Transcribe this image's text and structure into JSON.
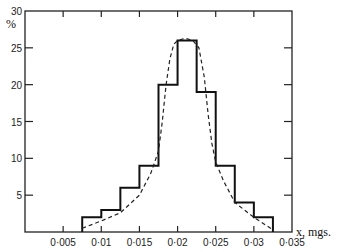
{
  "chart_data": {
    "type": "bar",
    "subtype": "histogram-with-fitted-curve",
    "title": "",
    "xlabel": "x, mgs.",
    "ylabel": "%",
    "xlim": [
      0,
      0.035
    ],
    "ylim": [
      0,
      30
    ],
    "grid": false,
    "legend": null,
    "x_ticks": [
      0.005,
      0.01,
      0.015,
      0.02,
      0.025,
      0.03,
      0.035
    ],
    "x_tick_labels": [
      "0·005",
      "0·01",
      "0·015",
      "0·02",
      "0·025",
      "0·03",
      "0·035"
    ],
    "y_ticks": [
      5,
      10,
      15,
      20,
      25,
      30
    ],
    "y_tick_labels": [
      "5",
      "10",
      "15",
      "20",
      "25",
      "30"
    ],
    "bin_edges": [
      0.0075,
      0.01,
      0.0125,
      0.015,
      0.0175,
      0.02,
      0.0225,
      0.025,
      0.0275,
      0.03,
      0.0325
    ],
    "series": [
      {
        "name": "Observed frequency (histogram)",
        "style": "solid-step",
        "values": [
          2,
          3,
          6,
          9,
          20,
          26,
          19,
          9,
          4,
          2
        ]
      },
      {
        "name": "Fitted curve",
        "style": "dashed",
        "points": [
          [
            0.0075,
            0.5
          ],
          [
            0.01,
            1.5
          ],
          [
            0.0125,
            2.6
          ],
          [
            0.015,
            5
          ],
          [
            0.0165,
            8
          ],
          [
            0.0175,
            11
          ],
          [
            0.018,
            15
          ],
          [
            0.0185,
            20
          ],
          [
            0.019,
            23.5
          ],
          [
            0.0195,
            25.5
          ],
          [
            0.02,
            26
          ],
          [
            0.021,
            26.3
          ],
          [
            0.022,
            26
          ],
          [
            0.0228,
            25
          ],
          [
            0.0235,
            21
          ],
          [
            0.024,
            16
          ],
          [
            0.0245,
            12
          ],
          [
            0.025,
            9.5
          ],
          [
            0.026,
            7
          ],
          [
            0.0275,
            4
          ],
          [
            0.03,
            2
          ],
          [
            0.0325,
            0.3
          ]
        ]
      }
    ]
  }
}
